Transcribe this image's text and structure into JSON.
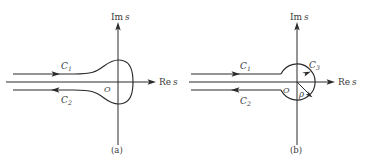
{
  "figure": {
    "type": "complex-plane-contour-diagram",
    "background_color": "#ffffff",
    "line_color": "#2a2a2a",
    "text_color": "#3a3a3a",
    "panels": [
      {
        "id": "a",
        "caption": "(a)",
        "axis_imaginary_label_prefix": "Im",
        "axis_imaginary_label_var": "s",
        "axis_real_label_prefix": "Re",
        "axis_real_label_var": "s",
        "origin_label": "O",
        "contour_shape": "keyhole-teardrop",
        "contours": [
          {
            "name": "C",
            "subscript": "1",
            "direction": "rightward",
            "position": "upper-branch"
          },
          {
            "name": "C",
            "subscript": "2",
            "direction": "leftward",
            "position": "lower-branch"
          }
        ]
      },
      {
        "id": "b",
        "caption": "(b)",
        "axis_imaginary_label_prefix": "Im",
        "axis_imaginary_label_var": "s",
        "axis_real_label_prefix": "Re",
        "axis_real_label_var": "s",
        "origin_label": "O",
        "radius_label": "ρ",
        "contour_shape": "keyhole-with-circle",
        "contours": [
          {
            "name": "C",
            "subscript": "1",
            "direction": "rightward",
            "position": "upper-branch"
          },
          {
            "name": "C",
            "subscript": "2",
            "direction": "leftward",
            "position": "lower-branch"
          },
          {
            "name": "C",
            "subscript": "3",
            "direction": "counterclockwise",
            "position": "circular-arc"
          }
        ]
      }
    ]
  }
}
